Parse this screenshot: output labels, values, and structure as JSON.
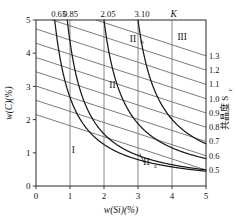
{
  "chart_data": {
    "type": "line",
    "title": "",
    "xlabel": "w(Si)(%)",
    "ylabel": "w(C)(%)",
    "xlim": [
      0,
      5
    ],
    "ylim": [
      0,
      5
    ],
    "grid": true,
    "xticks": [
      "0",
      "1",
      "2",
      "3",
      "4",
      "5"
    ],
    "yticks": [
      "0",
      "1",
      "2",
      "3",
      "4",
      "5"
    ],
    "top_axis": {
      "label": "K",
      "ticks": [
        "0.65",
        "0.85",
        "2.05",
        "3.10"
      ],
      "tick_x": [
        0.55,
        0.9,
        2.0,
        3.0
      ]
    },
    "right_axis": {
      "label": "共晶度 S",
      "label_sub": "c",
      "ticks": [
        "1.3",
        "1.2",
        "1.1",
        "1.0",
        "0.9",
        "0.8",
        "0.7",
        "0.6",
        "0.5"
      ],
      "values": [
        1.3,
        1.2,
        1.1,
        1.0,
        0.9,
        0.8,
        0.7,
        0.6,
        0.5
      ]
    },
    "series": [
      {
        "name": "Sc=1.3",
        "type": "sc-line",
        "x": [
          0,
          5
        ],
        "y": [
          5.59,
          3.92
        ]
      },
      {
        "name": "Sc=1.2",
        "type": "sc-line",
        "x": [
          0,
          5
        ],
        "y": [
          5.16,
          3.49
        ]
      },
      {
        "name": "Sc=1.1",
        "type": "sc-line",
        "x": [
          0,
          5
        ],
        "y": [
          4.73,
          3.06
        ]
      },
      {
        "name": "Sc=1.0",
        "type": "sc-line",
        "x": [
          0,
          5
        ],
        "y": [
          4.3,
          2.63
        ]
      },
      {
        "name": "Sc=0.9",
        "type": "sc-line",
        "x": [
          0,
          5
        ],
        "y": [
          3.87,
          2.2
        ]
      },
      {
        "name": "Sc=0.8",
        "type": "sc-line",
        "x": [
          0,
          5
        ],
        "y": [
          3.44,
          1.77
        ]
      },
      {
        "name": "Sc=0.7",
        "type": "sc-line",
        "x": [
          0,
          5
        ],
        "y": [
          3.01,
          1.34
        ]
      },
      {
        "name": "Sc=0.6",
        "type": "sc-line",
        "x": [
          0,
          5
        ],
        "y": [
          2.58,
          0.91
        ]
      },
      {
        "name": "Sc=0.5",
        "type": "sc-line",
        "x": [
          0,
          5
        ],
        "y": [
          2.15,
          0.48
        ]
      },
      {
        "name": "K=0.65",
        "type": "k-curve",
        "k": 0.65
      },
      {
        "name": "K=0.85",
        "type": "k-curve",
        "k": 0.85
      },
      {
        "name": "K=2.05",
        "type": "k-curve",
        "k": 2.05
      },
      {
        "name": "K=3.10",
        "type": "k-curve",
        "k": 3.1
      }
    ],
    "region_labels": [
      {
        "text": "I",
        "sub": "",
        "x": 1.1,
        "y": 1.0
      },
      {
        "text": "II",
        "sub": "",
        "x": 2.25,
        "y": 2.95
      },
      {
        "text": "II",
        "sub": "b",
        "x": 2.85,
        "y": 4.35
      },
      {
        "text": "II",
        "sub": "a",
        "x": 3.25,
        "y": 0.62
      },
      {
        "text": "III",
        "sub": "",
        "x": 4.3,
        "y": 4.4
      }
    ],
    "annotations": [
      {
        "name": "IIa-leader",
        "from_x": 3.05,
        "from_y": 0.98,
        "to_x": 3.18,
        "to_y": 0.7
      }
    ],
    "colors": {
      "axis": "#3c3c3c",
      "grid": "#6b6b6b",
      "sc_line": "#5a5a5a",
      "k_curve": "#1a1a1a",
      "text": "#111111",
      "background": "#ffffff"
    }
  }
}
